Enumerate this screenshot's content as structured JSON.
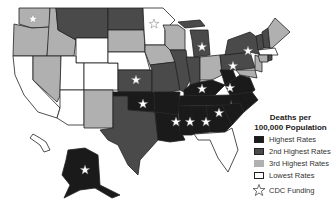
{
  "legend": {
    "title_line1": "Deaths per",
    "title_line2": "100,000 Population",
    "items": [
      {
        "label": "Highest Rates",
        "color": "#1a1a1a"
      },
      {
        "label": "2nd Highest Rates",
        "color": "#4a4a4a"
      },
      {
        "label": "3rd Highest Rates",
        "color": "#b0b0b0"
      },
      {
        "label": "Lowest Rates",
        "color": "#ffffff"
      }
    ],
    "star_label": "CDC Funding",
    "star_icon": "star-outline-icon"
  },
  "colors": {
    "highest": "#1a1a1a",
    "second": "#4a4a4a",
    "third": "#b0b0b0",
    "lowest": "#ffffff",
    "border": "#222222"
  }
}
